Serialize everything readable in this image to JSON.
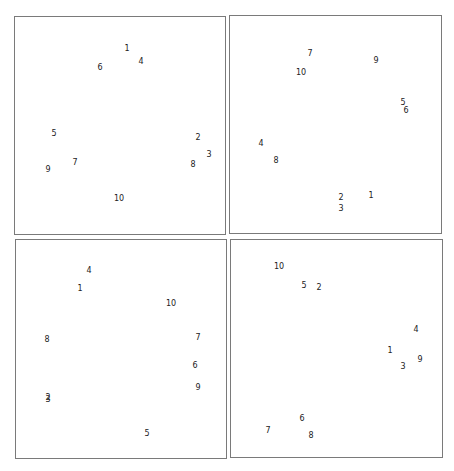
{
  "chart_data": [
    {
      "type": "scatter",
      "title": "",
      "xlabel": "",
      "ylabel": "",
      "grid": false,
      "axes_visible": false,
      "position": "top-left",
      "points": [
        {
          "label": "1",
          "x": 127,
          "y": 49
        },
        {
          "label": "2",
          "x": 198,
          "y": 138
        },
        {
          "label": "3",
          "x": 209,
          "y": 155
        },
        {
          "label": "4",
          "x": 141,
          "y": 62
        },
        {
          "label": "5",
          "x": 54,
          "y": 134
        },
        {
          "label": "6",
          "x": 100,
          "y": 68
        },
        {
          "label": "7",
          "x": 75,
          "y": 163
        },
        {
          "label": "8",
          "x": 193,
          "y": 165
        },
        {
          "label": "9",
          "x": 48,
          "y": 170
        },
        {
          "label": "10",
          "x": 119,
          "y": 199
        }
      ]
    },
    {
      "type": "scatter",
      "title": "",
      "xlabel": "",
      "ylabel": "",
      "grid": false,
      "axes_visible": false,
      "position": "top-right",
      "points": [
        {
          "label": "1",
          "x": 371,
          "y": 196
        },
        {
          "label": "2",
          "x": 341,
          "y": 198
        },
        {
          "label": "3",
          "x": 341,
          "y": 209
        },
        {
          "label": "4",
          "x": 261,
          "y": 144
        },
        {
          "label": "5",
          "x": 403,
          "y": 103
        },
        {
          "label": "6",
          "x": 406,
          "y": 111
        },
        {
          "label": "7",
          "x": 310,
          "y": 54
        },
        {
          "label": "8",
          "x": 276,
          "y": 161
        },
        {
          "label": "9",
          "x": 376,
          "y": 61
        },
        {
          "label": "10",
          "x": 301,
          "y": 73
        }
      ]
    },
    {
      "type": "scatter",
      "title": "",
      "xlabel": "",
      "ylabel": "",
      "grid": false,
      "axes_visible": false,
      "position": "bottom-left",
      "points": [
        {
          "label": "1",
          "x": 80,
          "y": 289
        },
        {
          "label": "2",
          "x": 48,
          "y": 398
        },
        {
          "label": "3",
          "x": 48,
          "y": 400
        },
        {
          "label": "4",
          "x": 89,
          "y": 271
        },
        {
          "label": "5",
          "x": 147,
          "y": 434
        },
        {
          "label": "6",
          "x": 195,
          "y": 366
        },
        {
          "label": "7",
          "x": 198,
          "y": 338
        },
        {
          "label": "8",
          "x": 47,
          "y": 340
        },
        {
          "label": "9",
          "x": 198,
          "y": 388
        },
        {
          "label": "10",
          "x": 171,
          "y": 304
        }
      ]
    },
    {
      "type": "scatter",
      "title": "",
      "xlabel": "",
      "ylabel": "",
      "grid": false,
      "axes_visible": false,
      "position": "bottom-right",
      "points": [
        {
          "label": "1",
          "x": 390,
          "y": 351
        },
        {
          "label": "2",
          "x": 319,
          "y": 288
        },
        {
          "label": "3",
          "x": 403,
          "y": 367
        },
        {
          "label": "4",
          "x": 416,
          "y": 330
        },
        {
          "label": "5",
          "x": 304,
          "y": 286
        },
        {
          "label": "6",
          "x": 302,
          "y": 419
        },
        {
          "label": "7",
          "x": 268,
          "y": 431
        },
        {
          "label": "8",
          "x": 311,
          "y": 436
        },
        {
          "label": "9",
          "x": 420,
          "y": 360
        },
        {
          "label": "10",
          "x": 279,
          "y": 267
        }
      ]
    }
  ],
  "panels": [
    {
      "left": 14,
      "top": 16,
      "width": 212,
      "height": 219
    },
    {
      "left": 229,
      "top": 15,
      "width": 213,
      "height": 219
    },
    {
      "left": 15,
      "top": 239,
      "width": 212,
      "height": 220
    },
    {
      "left": 230,
      "top": 239,
      "width": 213,
      "height": 219
    }
  ]
}
